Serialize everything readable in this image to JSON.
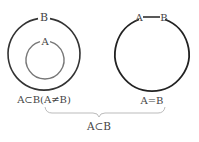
{
  "diagram": {
    "left": {
      "outer_label": "B",
      "inner_label": "A",
      "caption": "A⊂B(A≠B)"
    },
    "right": {
      "label_a": "A",
      "label_b": "B",
      "caption": "A=B"
    },
    "brace_caption": "A⊂B",
    "colors": {
      "outer_stroke": "#333333",
      "inner_stroke": "#777777",
      "brace": "#bbbbbb",
      "text": "#444444"
    }
  }
}
